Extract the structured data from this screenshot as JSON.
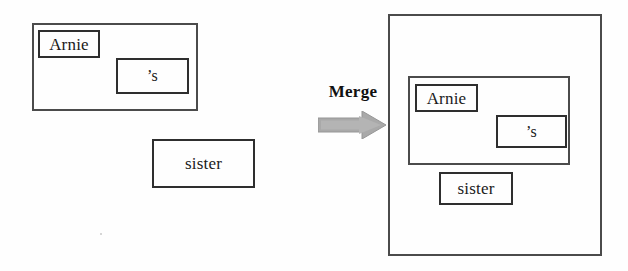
{
  "figure": {
    "background_color": "#fefefe",
    "box_border_color": "#3a3a3a",
    "arrow_color": "#a6a6a6",
    "text_color": "#1a1a1a"
  },
  "operator": {
    "label": "Merge",
    "arrow_icon": "right-block-arrow-icon",
    "arrow_color": "#a6a6a6",
    "arrow_outline_color": "#8f8f8f",
    "direction": "right"
  },
  "before": {
    "caption": "",
    "group": {
      "name": "possessive-phrase-group",
      "children": [
        {
          "name": "arnie",
          "label": "Arnie"
        },
        {
          "name": "possessive-s",
          "label": "’s"
        }
      ]
    },
    "standalone": {
      "name": "sister",
      "label": "sister"
    }
  },
  "after": {
    "caption": "",
    "root": {
      "name": "merged-root",
      "children": [
        {
          "name": "possessive-phrase-group",
          "children": [
            {
              "name": "arnie",
              "label": "Arnie"
            },
            {
              "name": "possessive-s",
              "label": "’s"
            }
          ]
        },
        {
          "name": "sister",
          "label": "sister"
        }
      ]
    }
  }
}
